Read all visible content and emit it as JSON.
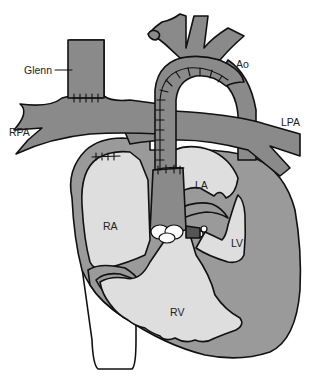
{
  "diagram": {
    "type": "anatomical-illustration",
    "colors": {
      "background": "#ffffff",
      "vessel_fill": "#8a8a8a",
      "wall_fill": "#999999",
      "chamber_fill": "#dedede",
      "outline": "#111111",
      "valve_fill": "#ffffff"
    }
  },
  "labels": {
    "glenn": "Glenn",
    "ao": "Ao",
    "rpa": "RPA",
    "lpa": "LPA",
    "la": "LA",
    "ra": "RA",
    "lv": "LV",
    "rv": "RV"
  }
}
